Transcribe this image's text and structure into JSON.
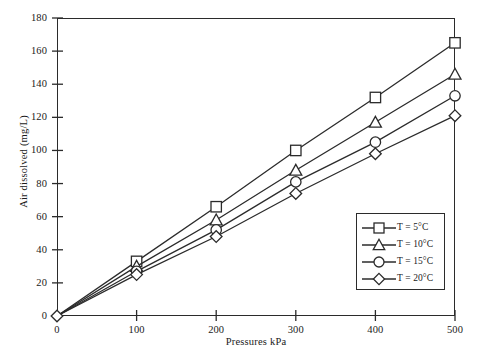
{
  "chart_data": {
    "type": "line",
    "title": "",
    "xlabel": "Pressures kPa",
    "ylabel": "Air dissolved (mg/L)",
    "x": [
      0,
      100,
      200,
      300,
      400,
      500
    ],
    "xlim": [
      0,
      500
    ],
    "ylim": [
      0,
      180
    ],
    "xticks": [
      "0",
      "100",
      "200",
      "300",
      "400",
      "500"
    ],
    "yticks": [
      "0",
      "20",
      "40",
      "60",
      "80",
      "100",
      "120",
      "140",
      "160",
      "180"
    ],
    "grid": false,
    "legend_position": "lower-right",
    "series": [
      {
        "name": "T = 5°C",
        "marker": "square",
        "values": [
          0,
          33,
          66,
          100,
          132,
          165
        ]
      },
      {
        "name": "T = 10°C",
        "marker": "triangle",
        "values": [
          0,
          30,
          58,
          88,
          117,
          146
        ]
      },
      {
        "name": "T = 15°C",
        "marker": "circle",
        "values": [
          0,
          27,
          52,
          81,
          105,
          133
        ]
      },
      {
        "name": "T = 20°C",
        "marker": "diamond",
        "values": [
          0,
          25,
          48,
          74,
          98,
          121
        ]
      }
    ],
    "colors": {
      "line": "#2b2b2b",
      "marker_fill": "#ffffff",
      "axis": "#2b2b2b",
      "background": "#ffffff"
    }
  }
}
